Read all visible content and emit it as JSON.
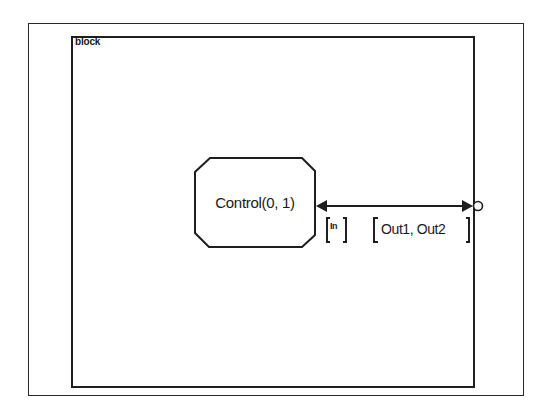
{
  "diagram": {
    "type": "statechart-block",
    "outer_frame": {
      "label": ""
    },
    "block": {
      "label": "block"
    },
    "nodes": [
      {
        "id": "control",
        "shape": "octagon",
        "label": "Control(0, 1)"
      }
    ],
    "edges": [
      {
        "from": "block-boundary-port",
        "to": "control",
        "direction": "bidirectional",
        "input_label": "In",
        "output_label": "Out1, Out2"
      }
    ],
    "ports": [
      {
        "id": "block-boundary-port",
        "shape": "circle",
        "position": "right-edge"
      }
    ]
  },
  "colors": {
    "line": "#1e1e1e",
    "background": "#ffffff"
  }
}
